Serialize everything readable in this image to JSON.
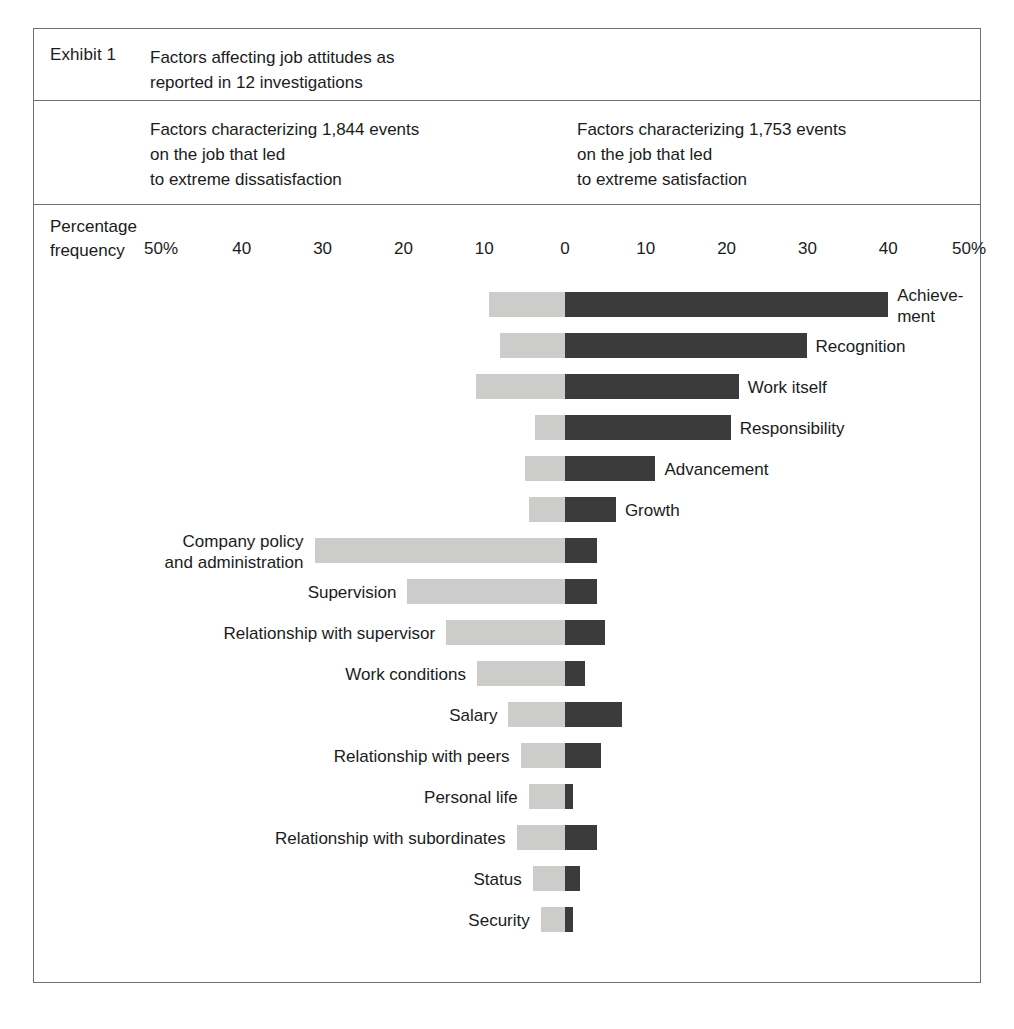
{
  "exhibit": {
    "label": "Exhibit 1",
    "title": "Factors affecting job attitudes as\nreported in 12 investigations",
    "left_header": "Factors characterizing 1,844 events\non the job that led\nto extreme dissatisfaction",
    "right_header": "Factors characterizing 1,753 events\non the job that led\nto extreme satisfaction",
    "axis_caption": "Percentage\nfrequency"
  },
  "chart_data": {
    "type": "bar",
    "orientation": "horizontal",
    "style": "diverging-bidirectional",
    "title": "Factors affecting job attitudes as reported in 12 investigations",
    "xlabel": "Percentage frequency",
    "ylabel": "",
    "xlim": [
      -50,
      50
    ],
    "grid": false,
    "legend_position": "none",
    "tick_labels": [
      "50%",
      "40",
      "30",
      "20",
      "10",
      "0",
      "10",
      "20",
      "30",
      "40",
      "50%"
    ],
    "tick_values": [
      -50,
      -40,
      -30,
      -20,
      -10,
      0,
      10,
      20,
      30,
      40,
      50
    ],
    "series": [
      {
        "name": "Dissatisfaction (left, light gray)",
        "color": "#ccccca"
      },
      {
        "name": "Satisfaction (right, dark gray)",
        "color": "#3b3b3b"
      }
    ],
    "categories": [
      "Achievement",
      "Recognition",
      "Work itself",
      "Responsibility",
      "Advancement",
      "Growth",
      "Company policy and administration",
      "Supervision",
      "Relationship with supervisor",
      "Work conditions",
      "Salary",
      "Relationship with peers",
      "Personal life",
      "Relationship with subordinates",
      "Status",
      "Security"
    ],
    "dissatisfaction": [
      9.4,
      8.1,
      11.0,
      3.7,
      4.9,
      4.4,
      31.0,
      19.5,
      14.7,
      10.9,
      7.0,
      5.5,
      4.5,
      6.0,
      4.0,
      3.0
    ],
    "satisfaction": [
      40.0,
      29.9,
      21.5,
      20.5,
      11.2,
      6.3,
      4.0,
      4.0,
      5.0,
      2.5,
      7.0,
      4.5,
      1.0,
      4.0,
      1.8,
      1.0
    ]
  },
  "bars": [
    {
      "label": "Achieve-\nment",
      "label_side": "right",
      "neg": 9.4,
      "pos": 40.0
    },
    {
      "label": "Recognition",
      "label_side": "right",
      "neg": 8.1,
      "pos": 29.9
    },
    {
      "label": "Work itself",
      "label_side": "right",
      "neg": 11.0,
      "pos": 21.5
    },
    {
      "label": "Responsibility",
      "label_side": "right",
      "neg": 3.7,
      "pos": 20.5
    },
    {
      "label": "Advancement",
      "label_side": "right",
      "neg": 4.9,
      "pos": 11.2
    },
    {
      "label": "Growth",
      "label_side": "right",
      "neg": 4.4,
      "pos": 6.3
    },
    {
      "label": "Company policy\nand administration",
      "label_side": "left",
      "neg": 31.0,
      "pos": 4.0
    },
    {
      "label": "Supervision",
      "label_side": "left",
      "neg": 19.5,
      "pos": 4.0
    },
    {
      "label": "Relationship with supervisor",
      "label_side": "left",
      "neg": 14.7,
      "pos": 5.0
    },
    {
      "label": "Work conditions",
      "label_side": "left",
      "neg": 10.9,
      "pos": 2.5
    },
    {
      "label": "Salary",
      "label_side": "left",
      "neg": 7.0,
      "pos": 7.0
    },
    {
      "label": "Relationship with peers",
      "label_side": "left",
      "neg": 5.5,
      "pos": 4.5
    },
    {
      "label": "Personal life",
      "label_side": "left",
      "neg": 4.5,
      "pos": 1.0
    },
    {
      "label": "Relationship with subordinates",
      "label_side": "left",
      "neg": 6.0,
      "pos": 4.0
    },
    {
      "label": "Status",
      "label_side": "left",
      "neg": 4.0,
      "pos": 1.8
    },
    {
      "label": "Security",
      "label_side": "left",
      "neg": 3.0,
      "pos": 1.0
    }
  ],
  "colors": {
    "dissatisfaction": "#ccccca",
    "satisfaction": "#3b3b3b",
    "border": "#6f6f6f",
    "text": "#1b1b1b"
  }
}
